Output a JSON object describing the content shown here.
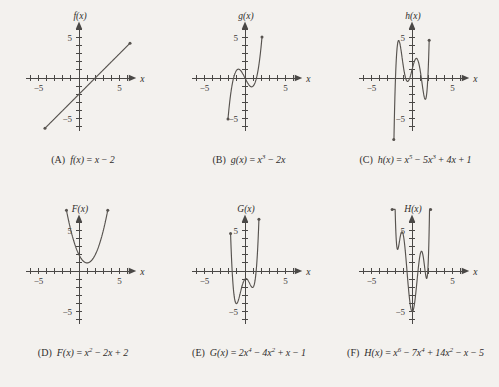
{
  "figure": {
    "background_color": "#f3f1ee",
    "curve_color": "#57534f",
    "axis_color": "#4a4846",
    "x_axis_label": "x",
    "tick_labels": {
      "x_negative": "−5",
      "x_positive": "5",
      "y_positive": "5",
      "y_negative": "−5"
    },
    "axis_range": {
      "xmin": -6.5,
      "xmax": 6.5,
      "ymin": -6.5,
      "ymax": 6.5
    },
    "tick_interval": 1
  },
  "panels": [
    {
      "id": "A",
      "tag": "(A)",
      "axis_name": "f(x)",
      "caption_name": "f(x)",
      "caption_terms": [
        {
          "text": "x",
          "sup": ""
        },
        {
          "op": "−"
        },
        {
          "text": "2",
          "sup": ""
        }
      ],
      "caption_plain": "(A)  f(x) = x − 2",
      "chart_data": {
        "type": "line",
        "title": "f(x) = x − 2",
        "xlabel": "x",
        "ylabel": "f(x)",
        "xlim": [
          -6.5,
          6.5
        ],
        "ylim": [
          -6.5,
          6.5
        ],
        "grid": false,
        "legend": "none",
        "coefficients": [
          -2,
          1
        ],
        "degree": 1,
        "x_domain": [
          -4.2,
          6.3
        ],
        "points": [
          {
            "x": -4.2,
            "y": -6.2
          },
          {
            "x": -2.0,
            "y": -4.0
          },
          {
            "x": 0.0,
            "y": -2.0
          },
          {
            "x": 2.0,
            "y": 0.0
          },
          {
            "x": 4.0,
            "y": 2.0
          },
          {
            "x": 6.3,
            "y": 4.3
          }
        ]
      }
    },
    {
      "id": "B",
      "tag": "(B)",
      "axis_name": "g(x)",
      "caption_name": "g(x)",
      "caption_terms": [
        {
          "text": "x",
          "sup": "3"
        },
        {
          "op": "−"
        },
        {
          "text": "2x",
          "sup": ""
        }
      ],
      "caption_plain": "(B)  g(x) = x³ − 2x",
      "chart_data": {
        "type": "line",
        "title": "g(x) = x³ − 2x",
        "xlabel": "x",
        "ylabel": "g(x)",
        "xlim": [
          -6.5,
          6.5
        ],
        "ylim": [
          -6.5,
          6.5
        ],
        "grid": false,
        "legend": "none",
        "coefficients": [
          0,
          -2,
          0,
          1
        ],
        "degree": 3,
        "x_domain": [
          -2.1,
          2.1
        ],
        "points": [
          {
            "x": -2.1,
            "y": -5.06
          },
          {
            "x": -1.5,
            "y": -0.375
          },
          {
            "x": -0.816,
            "y": 1.089
          },
          {
            "x": 0.0,
            "y": 0.0
          },
          {
            "x": 0.816,
            "y": -1.089
          },
          {
            "x": 1.5,
            "y": 0.375
          },
          {
            "x": 2.1,
            "y": 5.06
          }
        ]
      }
    },
    {
      "id": "C",
      "tag": "(C)",
      "axis_name": "h(x)",
      "caption_name": "h(x)",
      "caption_terms": [
        {
          "text": "x",
          "sup": "5"
        },
        {
          "op": "−"
        },
        {
          "text": "5x",
          "sup": "3"
        },
        {
          "op": "+"
        },
        {
          "text": "4x",
          "sup": ""
        },
        {
          "op": "+"
        },
        {
          "text": "1",
          "sup": ""
        }
      ],
      "caption_plain": "(C)  h(x) = x⁵ − 5x³ + 4x + 1",
      "chart_data": {
        "type": "line",
        "title": "h(x) = x⁵ − 5x³ + 4x + 1",
        "xlabel": "x",
        "ylabel": "h(x)",
        "xlim": [
          -6.5,
          6.5
        ],
        "ylim": [
          -6.5,
          6.5
        ],
        "grid": false,
        "legend": "none",
        "coefficients": [
          1,
          4,
          0,
          -5,
          0,
          1
        ],
        "degree": 5,
        "x_domain": [
          -2.25,
          2.12
        ],
        "points": [
          {
            "x": -2.25,
            "y": -6.2
          },
          {
            "x": -1.8,
            "y": 3.36
          },
          {
            "x": -1.64,
            "y": 4.8
          },
          {
            "x": -1.0,
            "y": 1.0
          },
          {
            "x": -0.47,
            "y": -0.36
          },
          {
            "x": 0.0,
            "y": 1.0
          },
          {
            "x": 0.5,
            "y": 2.4
          },
          {
            "x": 0.57,
            "y": 2.45
          },
          {
            "x": 1.0,
            "y": 1.0
          },
          {
            "x": 1.6,
            "y": -1.9
          },
          {
            "x": 1.75,
            "y": -2.2
          },
          {
            "x": 2.0,
            "y": 1.0
          },
          {
            "x": 2.12,
            "y": 5.0
          }
        ]
      }
    },
    {
      "id": "D",
      "tag": "(D)",
      "axis_name": "F(x)",
      "caption_name": "F(x)",
      "caption_terms": [
        {
          "text": "x",
          "sup": "2"
        },
        {
          "op": "−"
        },
        {
          "text": "2x",
          "sup": ""
        },
        {
          "op": "+"
        },
        {
          "text": "2",
          "sup": ""
        }
      ],
      "caption_plain": "(D)  F(x) = x² − 2x + 2",
      "chart_data": {
        "type": "line",
        "title": "F(x) = x² − 2x + 2",
        "xlabel": "x",
        "ylabel": "F(x)",
        "xlim": [
          -6.5,
          6.5
        ],
        "ylim": [
          -6.5,
          6.5
        ],
        "grid": false,
        "legend": "none",
        "coefficients": [
          2,
          -2,
          1
        ],
        "degree": 2,
        "x_domain": [
          -1.55,
          3.55
        ],
        "points": [
          {
            "x": -1.55,
            "y": 7.5
          },
          {
            "x": -1.0,
            "y": 5.0
          },
          {
            "x": 0.0,
            "y": 2.0
          },
          {
            "x": 1.0,
            "y": 1.0
          },
          {
            "x": 2.0,
            "y": 2.0
          },
          {
            "x": 3.0,
            "y": 5.0
          },
          {
            "x": 3.55,
            "y": 7.5
          }
        ]
      }
    },
    {
      "id": "E",
      "tag": "(E)",
      "axis_name": "G(x)",
      "caption_name": "G(x)",
      "caption_terms": [
        {
          "text": "2x",
          "sup": "4"
        },
        {
          "op": "−"
        },
        {
          "text": "4x",
          "sup": "2"
        },
        {
          "op": "+"
        },
        {
          "text": "x",
          "sup": ""
        },
        {
          "op": "−"
        },
        {
          "text": "1",
          "sup": ""
        }
      ],
      "caption_plain": "(E)  G(x) = 2x⁴ − 4x² + x − 1",
      "chart_data": {
        "type": "line",
        "title": "G(x) = 2x⁴ − 4x² + x − 1",
        "xlabel": "x",
        "ylabel": "G(x)",
        "xlim": [
          -6.5,
          6.5
        ],
        "ylim": [
          -6.5,
          6.5
        ],
        "grid": false,
        "legend": "none",
        "coefficients": [
          -1,
          1,
          -4,
          0,
          2
        ],
        "degree": 4,
        "x_domain": [
          -1.78,
          1.72
        ],
        "points": [
          {
            "x": -1.78,
            "y": 7.3
          },
          {
            "x": -1.5,
            "y": 1.62
          },
          {
            "x": -1.07,
            "y": -3.95
          },
          {
            "x": -1.0,
            "y": -4.0
          },
          {
            "x": -0.5,
            "y": -2.37
          },
          {
            "x": 0.0,
            "y": -1.0
          },
          {
            "x": 0.13,
            "y": -0.94
          },
          {
            "x": 0.5,
            "y": -1.37
          },
          {
            "x": 0.92,
            "y": -1.75
          },
          {
            "x": 1.2,
            "y": -0.96
          },
          {
            "x": 1.5,
            "y": 1.62
          },
          {
            "x": 1.72,
            "y": 6.2
          }
        ]
      }
    },
    {
      "id": "F",
      "tag": "(F)",
      "axis_name": "H(x)",
      "caption_name": "H(x)",
      "caption_terms": [
        {
          "text": "x",
          "sup": "6"
        },
        {
          "op": "−"
        },
        {
          "text": "7x",
          "sup": "4"
        },
        {
          "op": "+"
        },
        {
          "text": "14x",
          "sup": "2"
        },
        {
          "op": "−"
        },
        {
          "text": "x",
          "sup": ""
        },
        {
          "op": "−"
        },
        {
          "text": "5",
          "sup": ""
        }
      ],
      "caption_plain": "(F)  H(x) = x⁶ − 7x⁴ + 14x² − x − 5",
      "chart_data": {
        "type": "line",
        "title": "H(x) = x⁶ − 7x⁴ + 14x² − x − 5",
        "xlabel": "x",
        "ylabel": "H(x)",
        "xlim": [
          -6.5,
          6.5
        ],
        "ylim": [
          -6.5,
          6.5
        ],
        "grid": false,
        "legend": "none",
        "coefficients": [
          -5,
          -1,
          14,
          0,
          -7,
          0,
          1
        ],
        "degree": 6,
        "x_domain": [
          -2.45,
          2.3
        ],
        "points": [
          {
            "x": -2.45,
            "y": 7.2
          },
          {
            "x": -2.2,
            "y": 2.9
          },
          {
            "x": -2.06,
            "y": 2.2
          },
          {
            "x": -1.85,
            "y": 4.1
          },
          {
            "x": -1.66,
            "y": 5.1
          },
          {
            "x": -1.3,
            "y": 2.4
          },
          {
            "x": -1.0,
            "y": -1.0
          },
          {
            "x": -0.55,
            "y": -4.25
          },
          {
            "x": -0.2,
            "y": -4.25
          },
          {
            "x": 0.0,
            "y": -5.0
          },
          {
            "x": 0.1,
            "y": -5.05
          },
          {
            "x": 0.45,
            "y": -3.2
          },
          {
            "x": 0.9,
            "y": 0.95
          },
          {
            "x": 1.12,
            "y": 1.6
          },
          {
            "x": 1.4,
            "y": 0.1
          },
          {
            "x": 1.73,
            "y": -1.2
          },
          {
            "x": 1.95,
            "y": 0.6
          },
          {
            "x": 2.3,
            "y": 7.0
          }
        ]
      }
    }
  ]
}
